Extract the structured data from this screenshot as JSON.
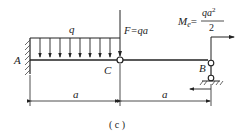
{
  "figure": {
    "caption": "( c )",
    "labels": {
      "support_a": "A",
      "hinge_c": "C",
      "support_b": "B",
      "distributed_load": "q",
      "force": "F=qa",
      "moment_prefix": "M",
      "moment_sub": "e",
      "moment_eq": "=",
      "moment_num": "qa",
      "moment_num_exp": "2",
      "moment_den": "2",
      "span_left": "a",
      "span_right": "a"
    }
  }
}
